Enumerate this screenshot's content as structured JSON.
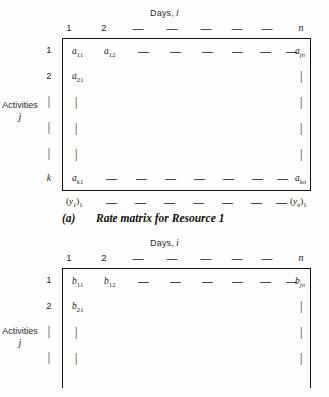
{
  "figures": [
    {
      "id": "a",
      "days_heading": {
        "text": "Days,",
        "symbol": "i"
      },
      "column_headers": [
        "1",
        "2",
        "—",
        "—",
        "—",
        "—",
        "—",
        "—",
        "—",
        "n"
      ],
      "row_labels": [
        "1",
        "2",
        "|",
        "|",
        "|",
        "k"
      ],
      "side_label": {
        "text": "Activities",
        "symbol": "j"
      },
      "rows": [
        {
          "cells": [
            {
              "base": "a",
              "sub": "11"
            },
            {
              "base": "a",
              "sub": "12"
            },
            {
              "base": "—"
            },
            {
              "base": "—"
            },
            {
              "base": "—"
            },
            {
              "base": "—"
            },
            {
              "base": "—"
            },
            {
              "base": "—"
            },
            {
              "base": "—"
            },
            {
              "base": "a",
              "sub": "jn",
              "sub_italic": true
            }
          ]
        },
        {
          "cells": [
            {
              "base": "a",
              "sub": "21"
            },
            {
              "base": "|",
              "last": true
            }
          ]
        },
        {
          "cells": [
            {
              "base": "|"
            },
            {
              "base": "|",
              "last": true
            }
          ]
        },
        {
          "cells": [
            {
              "base": "|"
            },
            {
              "base": "|",
              "last": true
            }
          ]
        },
        {
          "cells": [
            {
              "base": "|"
            },
            {
              "base": "|",
              "last": true
            }
          ]
        },
        {
          "cells": [
            {
              "base": "a",
              "sub": "k1",
              "sub_italic": true
            },
            {
              "base": "—"
            },
            {
              "base": "—"
            },
            {
              "base": "—"
            },
            {
              "base": "—"
            },
            {
              "base": "—"
            },
            {
              "base": "—"
            },
            {
              "base": "—"
            },
            {
              "base": "—"
            },
            {
              "base": "a",
              "sub": "kn",
              "sub_italic": true
            }
          ]
        }
      ],
      "vector_row": [
        {
          "text": "(y",
          "sub": "1",
          "sub_italic": true,
          "close": ")",
          "outer_sub": "1"
        },
        {
          "text": "—"
        },
        {
          "text": "—"
        },
        {
          "text": "—"
        },
        {
          "text": "—"
        },
        {
          "text": "—"
        },
        {
          "text": "—"
        },
        {
          "text": "—"
        },
        {
          "text": "—"
        },
        {
          "text": "(y",
          "sub": "n",
          "sub_italic": true,
          "close": ")",
          "outer_sub": "1"
        }
      ],
      "caption": {
        "tag": "(a)",
        "text": "Rate matrix for Resource 1"
      }
    },
    {
      "id": "b",
      "days_heading": {
        "text": "Days,",
        "symbol": "i"
      },
      "column_headers": [
        "1",
        "2",
        "—",
        "—",
        "—",
        "—",
        "—",
        "—",
        "—",
        "n"
      ],
      "row_labels": [
        "1",
        "2",
        "|",
        "|"
      ],
      "side_label": {
        "text": "Activities",
        "symbol": "j"
      },
      "rows": [
        {
          "cells": [
            {
              "base": "b",
              "sub": "11"
            },
            {
              "base": "b",
              "sub": "12"
            },
            {
              "base": "—"
            },
            {
              "base": "—"
            },
            {
              "base": "—"
            },
            {
              "base": "—"
            },
            {
              "base": "—"
            },
            {
              "base": "—"
            },
            {
              "base": "—"
            },
            {
              "base": "b",
              "sub": "jn",
              "sub_italic": true
            }
          ]
        },
        {
          "cells": [
            {
              "base": "b",
              "sub": "21"
            },
            {
              "base": "|",
              "last": true
            }
          ]
        },
        {
          "cells": [
            {
              "base": "|"
            },
            {
              "base": "|",
              "last": true
            }
          ]
        },
        {
          "cells": [
            {
              "base": "|"
            },
            {
              "base": "|",
              "last": true
            }
          ]
        }
      ],
      "vector_row": [],
      "caption": null
    }
  ],
  "geometry": {
    "col_x": [
      10,
      48,
      84,
      118,
      152,
      186,
      216,
      246,
      273,
      239
    ],
    "row_y": [
      8,
      33,
      59,
      85,
      111,
      136
    ]
  }
}
